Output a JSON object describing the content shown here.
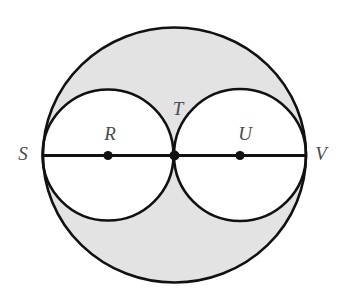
{
  "figure": {
    "type": "geometry-diagram",
    "background_color": "#ffffff",
    "shaded_color": "#e3e3e3",
    "stroke_color": "#111111",
    "label_color": "#4a4a4a",
    "canvas": {
      "width": 342,
      "height": 295
    },
    "large_circle": {
      "name": "circle-SV",
      "center_x": 174.5,
      "center_y": 155,
      "radius": 131.5,
      "radius_y": 127.5,
      "stroke_width": 2.6,
      "fill": "#e3e3e3"
    },
    "small_circles": [
      {
        "name": "circle-R",
        "label": "R",
        "center_x": 108,
        "center_y": 155,
        "radius": 65.5,
        "fill": "#ffffff",
        "stroke_width": 2.6
      },
      {
        "name": "circle-U",
        "label": "U",
        "center_x": 240,
        "center_y": 155,
        "radius": 66,
        "fill": "#ffffff",
        "stroke_width": 2.6
      }
    ],
    "diameter_segment": {
      "name": "segment-SV",
      "x1": 43,
      "y1": 155.5,
      "x2": 306,
      "y2": 155.5,
      "stroke_width": 2.8
    },
    "center_dots": [
      {
        "name": "dot-R",
        "cx": 108,
        "cy": 155.5,
        "r": 4.6
      },
      {
        "name": "dot-T",
        "cx": 174.5,
        "cy": 155.5,
        "r": 5.0
      },
      {
        "name": "dot-U",
        "cx": 240,
        "cy": 155.5,
        "r": 4.6
      }
    ],
    "labels": [
      {
        "name": "label-S",
        "text": "S",
        "x": 23,
        "y": 155,
        "font_size": 19
      },
      {
        "name": "label-R",
        "text": "R",
        "x": 110,
        "y": 135,
        "font_size": 19
      },
      {
        "name": "label-T",
        "text": "T",
        "x": 178,
        "y": 110,
        "font_size": 19
      },
      {
        "name": "label-U",
        "text": "U",
        "x": 245,
        "y": 135,
        "font_size": 19
      },
      {
        "name": "label-V",
        "text": "V",
        "x": 321,
        "y": 155,
        "font_size": 19
      }
    ],
    "label_texts": {
      "S": "S",
      "R": "R",
      "T": "T",
      "U": "U",
      "V": "V"
    }
  }
}
